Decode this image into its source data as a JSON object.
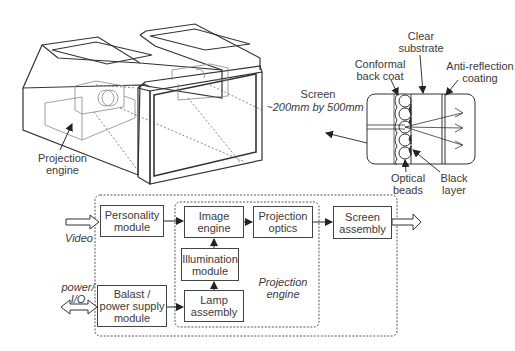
{
  "illustration": {
    "labels": {
      "projection_engine": "Projection\nengine",
      "screen_title": "Screen",
      "screen_size": "~200mm by 500mm",
      "clear_substrate": "Clear\nsubstrate",
      "conformal_back_coat": "Conformal\nback coat",
      "anti_reflection": "Anti-reflection\ncoating",
      "optical_beads": "Optical\nbeads",
      "black_layer": "Black\nlayer"
    }
  },
  "block_diagram": {
    "inputs": {
      "video": "Video",
      "power_io": "power/\nI/O"
    },
    "blocks": {
      "personality": "Personality\nmodule",
      "balast": "Balast /\npower supply\nmodule",
      "image_engine": "Image\nengine",
      "illumination": "Illumination\nmodule",
      "lamp": "Lamp\nassembly",
      "projection_optics": "Projection\noptics",
      "screen_assembly": "Screen\nassembly"
    },
    "group_label": "Projection\nengine"
  }
}
